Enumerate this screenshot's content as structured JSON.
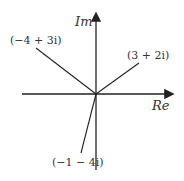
{
  "diagram": {
    "axes": {
      "real_label": "Re",
      "imag_label": "Im"
    },
    "vectors": [
      {
        "label": "(3 + 2i)",
        "re": 3,
        "im": 2
      },
      {
        "label": "(−4 + 3i)",
        "re": -4,
        "im": 3
      },
      {
        "label": "(−1 − 4i)",
        "re": -1,
        "im": -4
      }
    ],
    "colors": {
      "line": "#222222",
      "text": "#333333"
    }
  }
}
